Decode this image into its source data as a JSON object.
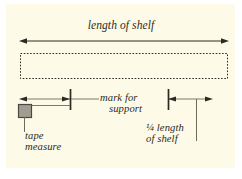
{
  "figure": {
    "kind": "measurement-diagram",
    "subject": "shelf",
    "background_color": "#fdfbe8",
    "page_color": "#ffffff",
    "ink_color": "#2b2a23",
    "tape_measure_color": "#a09e93"
  },
  "labels": {
    "title": "length of shelf",
    "mark_line1": "mark for",
    "mark_line2": "support",
    "tape_line1": "tape",
    "tape_line2": "measure",
    "quarter_line1": "¼ length",
    "quarter_line2": "of shelf"
  },
  "diagram_data": {
    "type": "diagram",
    "title": "length of shelf",
    "elements": [
      {
        "name": "overall-span-arrow",
        "kind": "double-headed-arrow",
        "label": "length of shelf",
        "x_start": 20,
        "x_end": 228,
        "y": 41
      },
      {
        "name": "shelf-outline",
        "kind": "dashed-rectangle",
        "x": 20,
        "y": 53,
        "width": 208,
        "height": 26
      },
      {
        "name": "left-measure-arrow",
        "kind": "single-headed-arrow",
        "direction": "left",
        "x_start": 70,
        "x_end": 20,
        "y": 99
      },
      {
        "name": "support-mark-tick",
        "kind": "vertical-tick",
        "x": 70,
        "y_top": 90,
        "y_bottom": 110,
        "label": "mark for support"
      },
      {
        "name": "support-mark-leader",
        "kind": "horizontal-line",
        "x_start": 70,
        "x_end": 99,
        "y": 99
      },
      {
        "name": "tape-measure-body",
        "kind": "square",
        "x": 18,
        "y": 104,
        "width": 14,
        "height": 14,
        "label": "tape measure"
      },
      {
        "name": "tape-measure-blade",
        "kind": "horizontal-line",
        "x_start": 32,
        "x_end": 70,
        "y": 105
      },
      {
        "name": "tape-measure-leader",
        "kind": "vertical-line",
        "x": 24,
        "y_top": 118,
        "y_bottom": 132
      },
      {
        "name": "quarter-mark-tick",
        "kind": "vertical-tick",
        "x": 168,
        "y_top": 90,
        "y_bottom": 110,
        "label": "¼ length of shelf"
      },
      {
        "name": "quarter-measure-arrow",
        "kind": "single-headed-arrow",
        "direction": "right",
        "x_start": 168,
        "x_end": 212,
        "y": 99
      },
      {
        "name": "quarter-leader",
        "kind": "vertical-line",
        "x": 196,
        "y_top": 99,
        "y_bottom": 141
      }
    ]
  }
}
